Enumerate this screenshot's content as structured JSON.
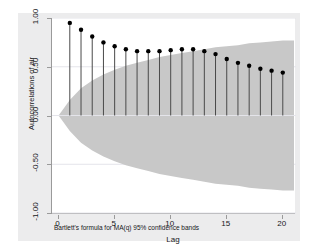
{
  "chart_data": {
    "type": "line",
    "subtype": "stem-with-confidence-band",
    "title": "",
    "xlabel": "Lag",
    "ylabel": "Autocorrelations of air",
    "note": "Bartlett's formula for MA(q) 95% confidence bands",
    "grid": true,
    "legend_position": "none",
    "xlim": [
      -0.5,
      21
    ],
    "ylim": [
      -1.0,
      1.0
    ],
    "xticks": [
      0,
      5,
      10,
      15,
      20
    ],
    "xtick_labels": [
      "0",
      "5",
      "10",
      "15",
      "20"
    ],
    "yticks": [
      -1.0,
      -0.5,
      0.0,
      0.5,
      1.0
    ],
    "ytick_labels": [
      "-1.00",
      "-0.50",
      "0.00",
      "0.50",
      "1.00"
    ],
    "x": [
      1,
      2,
      3,
      4,
      5,
      6,
      7,
      8,
      9,
      10,
      11,
      12,
      13,
      14,
      15,
      16,
      17,
      18,
      19,
      20
    ],
    "values": [
      0.95,
      0.88,
      0.81,
      0.75,
      0.71,
      0.68,
      0.66,
      0.66,
      0.66,
      0.67,
      0.68,
      0.68,
      0.66,
      0.63,
      0.58,
      0.54,
      0.51,
      0.48,
      0.46,
      0.44
    ],
    "series": [
      {
        "name": "Autocorrelations of air",
        "values": [
          0.95,
          0.88,
          0.81,
          0.75,
          0.71,
          0.68,
          0.66,
          0.66,
          0.66,
          0.67,
          0.68,
          0.68,
          0.66,
          0.63,
          0.58,
          0.54,
          0.51,
          0.48,
          0.46,
          0.44
        ]
      }
    ],
    "confidence_band": {
      "label": "Bartlett's formula for MA(q) 95% confidence bands",
      "level": 0.95,
      "color": "#c8c8c8",
      "upper": [
        0.16,
        0.28,
        0.36,
        0.42,
        0.47,
        0.51,
        0.54,
        0.57,
        0.6,
        0.62,
        0.64,
        0.66,
        0.68,
        0.7,
        0.71,
        0.72,
        0.74,
        0.75,
        0.76,
        0.77
      ],
      "lower": [
        -0.16,
        -0.28,
        -0.36,
        -0.42,
        -0.47,
        -0.51,
        -0.54,
        -0.57,
        -0.6,
        -0.62,
        -0.64,
        -0.66,
        -0.68,
        -0.7,
        -0.71,
        -0.72,
        -0.74,
        -0.75,
        -0.76,
        -0.77
      ]
    },
    "marker_color": "#000000",
    "stem_color": "#4a4a4a",
    "baseline": 0.0
  },
  "axis": {
    "y_title": "Autocorrelations of air",
    "x_title": "Lag",
    "y_labels": [
      "1.00",
      "0.50",
      "0.00",
      "-0.50",
      "-1.00"
    ],
    "x_labels": [
      "0",
      "5",
      "10",
      "15",
      "20"
    ]
  },
  "footnote": {
    "text": "Bartlett's formula for MA(q) 95% confidence bands"
  },
  "colors": {
    "figure_background": "#ffffff",
    "graph_background": "#ececed",
    "plot_background": "#ffffff",
    "axis_line": "#9a9a9a",
    "grid_line": "#e4e4ea",
    "band_fill": "#c8c8c8",
    "marker": "#000000",
    "stem": "#4a4a4a",
    "text": "#17171a"
  }
}
